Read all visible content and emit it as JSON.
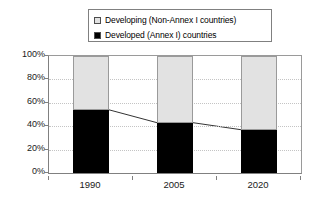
{
  "chart_data": {
    "type": "bar",
    "subtype": "stacked-bar-100-percent",
    "title": "",
    "subtitle": "",
    "xlabel": "",
    "ylabel": "",
    "categories": [
      "1990",
      "2005",
      "2020"
    ],
    "series": [
      {
        "name": "Developed (Annex I) countries",
        "color": "#000000",
        "values": [
          54,
          43,
          37
        ],
        "stack_order": "bottom"
      },
      {
        "name": "Developing (Non-Annex I countries)",
        "color": "#e2e2e2",
        "values": [
          46,
          57,
          63
        ],
        "stack_order": "top"
      }
    ],
    "connector_line": {
      "name": "Developed share trend",
      "values": [
        54,
        43,
        37
      ],
      "color": "#333333"
    },
    "ylim": [
      0,
      100
    ],
    "yticks": [
      0,
      20,
      40,
      60,
      80,
      100
    ],
    "ytick_labels": [
      "0%",
      "20%",
      "40%",
      "60%",
      "80%",
      "100%"
    ],
    "grid": true,
    "grid_style": "dotted",
    "grid_color": "#c4c4c4",
    "legend_position": "top-center",
    "axis_color": "#808080",
    "background": "#ffffff"
  },
  "legend": {
    "items": [
      {
        "label": "Developing (Non-Annex I countries)",
        "swatch": "legend-swatch-developing"
      },
      {
        "label": "Developed (Annex I) countries",
        "swatch": "legend-swatch-developed"
      }
    ]
  },
  "axes": {
    "y_tick_labels": [
      "100%",
      "80%",
      "60%",
      "40%",
      "20%",
      "0%"
    ],
    "x_tick_labels": [
      "1990",
      "2005",
      "2020"
    ]
  }
}
